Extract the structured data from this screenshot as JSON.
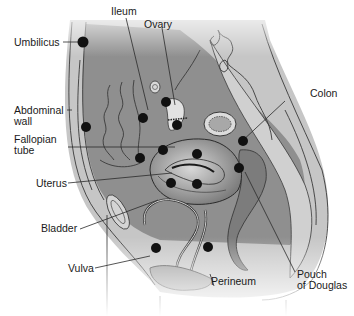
{
  "diagram": {
    "type": "anatomical sagittal section (female pelvis)",
    "colors": {
      "background": "#ffffff",
      "abdominal_fill": "#8c8c8c",
      "body_wall_fill": "#c4c4c4",
      "organ_fill": "#b0b0b0",
      "dark_organ": "#6e6e6e",
      "outline": "#2a2a2a",
      "marker": "#111111"
    },
    "labels": [
      {
        "id": "ileum",
        "text": "Ileum"
      },
      {
        "id": "ovary",
        "text": "Ovary"
      },
      {
        "id": "umbilicus",
        "text": "Umbilicus"
      },
      {
        "id": "colon",
        "text": "Colon"
      },
      {
        "id": "abdominal-wall-1",
        "text": "Abdominal"
      },
      {
        "id": "abdominal-wall-2",
        "text": "wall"
      },
      {
        "id": "fallopian-tube-1",
        "text": "Fallopian"
      },
      {
        "id": "fallopian-tube-2",
        "text": "tube"
      },
      {
        "id": "uterus",
        "text": "Uterus"
      },
      {
        "id": "bladder",
        "text": "Bladder"
      },
      {
        "id": "vulva",
        "text": "Vulva"
      },
      {
        "id": "perineum",
        "text": "Perineum"
      },
      {
        "id": "pouch-of-douglas-1",
        "text": "Pouch"
      },
      {
        "id": "pouch-of-douglas-2",
        "text": "of Douglas"
      }
    ],
    "marker_count": 17
  }
}
